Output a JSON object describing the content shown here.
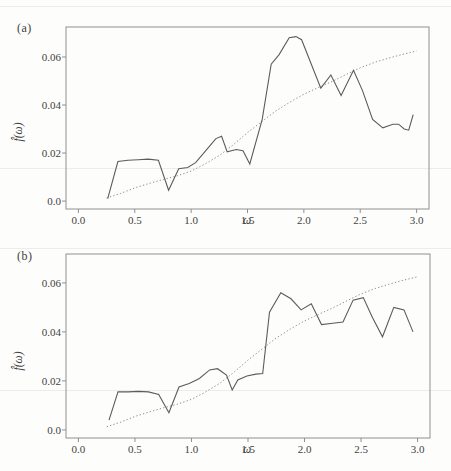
{
  "figure": {
    "background": "#fdfdfc",
    "text_color": "#3e3e3e",
    "axis_color": "#909090",
    "solid_line_color": "#5c5c5c",
    "dotted_line_color": "#8d8d8d",
    "artifact_line_color": "#ecece8",
    "artifact_lines_y": [
      6,
      168,
      248,
      390
    ]
  },
  "chart_data": [
    {
      "type": "line",
      "panel_label": "(a)",
      "xlabel": "ω",
      "ylabel": "f̂(ω)",
      "xlim": [
        -0.11,
        3.11
      ],
      "ylim": [
        -0.0033,
        0.0725
      ],
      "grid": false,
      "legend_position": "none",
      "x_ticks": [
        0,
        0.5,
        1,
        1.5,
        2,
        2.5,
        3
      ],
      "x_tick_labels": [
        "0.0",
        "0.5",
        "1.0",
        "1.5",
        "2.0",
        "2.5",
        "3.0"
      ],
      "y_ticks": [
        0,
        0.02,
        0.04,
        0.06
      ],
      "y_tick_labels": [
        "0.0",
        "0.02",
        "0.04",
        "0.06"
      ],
      "series": [
        {
          "name": "spectral-estimate",
          "style": "solid",
          "x": [
            0.26,
            0.35,
            0.44,
            0.53,
            0.62,
            0.71,
            0.8,
            0.89,
            0.97,
            1.04,
            1.13,
            1.22,
            1.27,
            1.32,
            1.4,
            1.46,
            1.52,
            1.63,
            1.71,
            1.78,
            1.87,
            1.93,
            1.98,
            2.15,
            2.24,
            2.33,
            2.44,
            2.52,
            2.61,
            2.7,
            2.79,
            2.84,
            2.89,
            2.93,
            2.97
          ],
          "y": [
            0.001,
            0.0165,
            0.017,
            0.0172,
            0.0175,
            0.017,
            0.0045,
            0.0135,
            0.014,
            0.016,
            0.021,
            0.026,
            0.027,
            0.0205,
            0.0215,
            0.021,
            0.0155,
            0.034,
            0.057,
            0.061,
            0.068,
            0.0685,
            0.0672,
            0.047,
            0.0525,
            0.044,
            0.0545,
            0.046,
            0.034,
            0.0305,
            0.032,
            0.032,
            0.03,
            0.0295,
            0.036
          ]
        },
        {
          "name": "true-spectrum",
          "style": "dotted",
          "x": [
            0.25,
            0.375,
            0.5,
            0.625,
            0.75,
            0.875,
            1.0,
            1.125,
            1.25,
            1.375,
            1.5,
            1.625,
            1.75,
            1.875,
            2.0,
            2.125,
            2.25,
            2.375,
            2.5,
            2.625,
            2.75,
            2.875,
            3.0
          ],
          "y": [
            0.0013,
            0.0032,
            0.0055,
            0.0073,
            0.009,
            0.0105,
            0.0125,
            0.0155,
            0.019,
            0.0235,
            0.0285,
            0.033,
            0.0375,
            0.0412,
            0.0445,
            0.0472,
            0.0498,
            0.0527,
            0.0555,
            0.0577,
            0.0595,
            0.0611,
            0.0625
          ]
        }
      ]
    },
    {
      "type": "line",
      "panel_label": "(b)",
      "xlabel": "ω",
      "ylabel": "f̂(ω)",
      "xlim": [
        -0.11,
        3.11
      ],
      "ylim": [
        -0.0033,
        0.0718
      ],
      "grid": false,
      "legend_position": "none",
      "x_ticks": [
        0,
        0.5,
        1,
        1.5,
        2,
        2.5,
        3
      ],
      "x_tick_labels": [
        "0.0",
        "0.5",
        "1.0",
        "1.5",
        "2.0",
        "2.5",
        "3.0"
      ],
      "y_ticks": [
        0,
        0.02,
        0.04,
        0.06
      ],
      "y_tick_labels": [
        "0.0",
        "0.02",
        "0.04",
        "0.06"
      ],
      "series": [
        {
          "name": "spectral-estimate",
          "style": "solid",
          "x": [
            0.27,
            0.35,
            0.44,
            0.53,
            0.62,
            0.71,
            0.8,
            0.89,
            0.98,
            1.07,
            1.16,
            1.23,
            1.31,
            1.36,
            1.41,
            1.49,
            1.57,
            1.63,
            1.69,
            1.79,
            1.88,
            1.97,
            2.06,
            2.15,
            2.25,
            2.34,
            2.43,
            2.52,
            2.6,
            2.69,
            2.79,
            2.88,
            2.96
          ],
          "y": [
            0.004,
            0.0155,
            0.0155,
            0.0157,
            0.0155,
            0.0145,
            0.007,
            0.0175,
            0.019,
            0.021,
            0.0245,
            0.025,
            0.0224,
            0.0163,
            0.0204,
            0.022,
            0.0228,
            0.023,
            0.048,
            0.056,
            0.0535,
            0.049,
            0.0515,
            0.043,
            0.0435,
            0.044,
            0.053,
            0.054,
            0.046,
            0.038,
            0.05,
            0.049,
            0.04
          ]
        },
        {
          "name": "true-spectrum",
          "style": "dotted",
          "x": [
            0.25,
            0.375,
            0.5,
            0.625,
            0.75,
            0.875,
            1.0,
            1.125,
            1.25,
            1.375,
            1.5,
            1.625,
            1.75,
            1.875,
            2.0,
            2.125,
            2.25,
            2.375,
            2.5,
            2.625,
            2.75,
            2.875,
            3.0
          ],
          "y": [
            0.0013,
            0.0032,
            0.0055,
            0.0073,
            0.009,
            0.0105,
            0.0125,
            0.0155,
            0.019,
            0.0235,
            0.0285,
            0.033,
            0.0375,
            0.0412,
            0.0445,
            0.0472,
            0.0498,
            0.0527,
            0.0555,
            0.0577,
            0.0595,
            0.0611,
            0.0625
          ]
        }
      ]
    }
  ]
}
